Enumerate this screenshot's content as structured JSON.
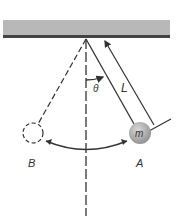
{
  "diagram": {
    "type": "simple-pendulum",
    "labels": {
      "angle": "θ",
      "length": "L",
      "mass": "m",
      "position_a": "A",
      "position_b": "B"
    },
    "colors": {
      "ceiling_fill": "#b8b8b8",
      "ceiling_edge": "#444444",
      "line": "#333333",
      "bob_fill": "#a8a8a8"
    }
  }
}
